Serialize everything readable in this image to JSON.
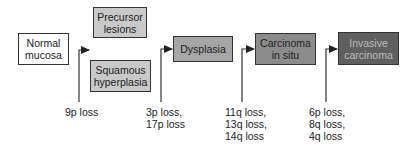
{
  "diagram": {
    "title": "",
    "nodes": [
      {
        "id": "normal",
        "label": "Normal\nmucosa",
        "fill": "#ffffff",
        "text_color": "#222222"
      },
      {
        "id": "precursor",
        "label": "Precursor\nlesions",
        "fill": "#c9c9c9",
        "text_color": "#222222"
      },
      {
        "id": "hyperplasia",
        "label": "Squamous\nhyperplasia",
        "fill": "#c9c9c9",
        "text_color": "#222222"
      },
      {
        "id": "dysplasia",
        "label": "Dysplasia",
        "fill": "#a6a6a6",
        "text_color": "#222222"
      },
      {
        "id": "cis",
        "label": "Carcinoma\nin situ",
        "fill": "#8c8c8c",
        "text_color": "#222222"
      },
      {
        "id": "invasive",
        "label": "Invasive\ncarcinoma",
        "fill": "#5f5f5f",
        "text_color": "#bbbbbb"
      }
    ],
    "transitions": [
      {
        "arrow_to": "precursor/hyperplasia",
        "event": "9p loss"
      },
      {
        "arrow_to": "dysplasia",
        "event": "3p loss,\n17p loss"
      },
      {
        "arrow_to": "cis",
        "event": "11q loss,\n13q loss,\n14q loss"
      },
      {
        "arrow_to": "invasive",
        "event": "6p loss,\n8q loss,\n4q loss"
      }
    ]
  }
}
